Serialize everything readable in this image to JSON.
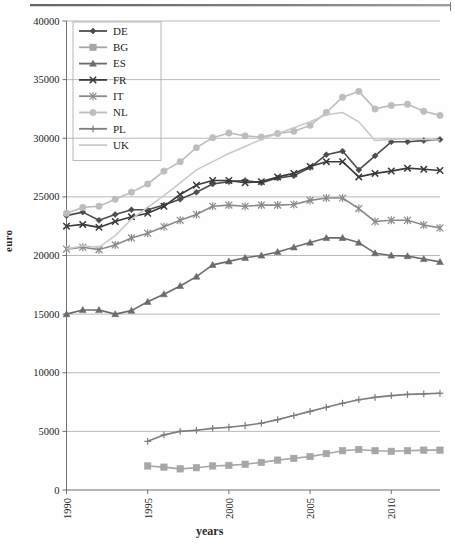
{
  "chart_data": {
    "type": "line",
    "title": "",
    "xlabel": "years",
    "ylabel": "euro",
    "xlim": [
      1990,
      2013
    ],
    "ylim": [
      0,
      40000
    ],
    "ytick_labels": [
      "0",
      "5000",
      "10000",
      "15000",
      "20000",
      "25000",
      "30000",
      "35000",
      "40000"
    ],
    "ytick_values": [
      0,
      5000,
      10000,
      15000,
      20000,
      25000,
      30000,
      35000,
      40000
    ],
    "xtick_labels": [
      "1990",
      "1995",
      "2000",
      "2005",
      "2010"
    ],
    "xtick_values": [
      1990,
      1995,
      2000,
      2005,
      2010
    ],
    "grid": "horizontal",
    "legend_position": "top-left",
    "x": [
      1990,
      1991,
      1992,
      1993,
      1994,
      1995,
      1996,
      1997,
      1998,
      1999,
      2000,
      2001,
      2002,
      2003,
      2004,
      2005,
      2006,
      2007,
      2008,
      2009,
      2010,
      2011,
      2012,
      2013
    ],
    "series": [
      {
        "name": "DE",
        "label": "DE",
        "color": "#4d4d4d",
        "marker": "diamond",
        "x": [
          1990,
          1991,
          1992,
          1993,
          1994,
          1995,
          1996,
          1997,
          1998,
          1999,
          2000,
          2001,
          2002,
          2003,
          2004,
          2005,
          2006,
          2007,
          2008,
          2009,
          2010,
          2011,
          2012,
          2013
        ],
        "values": [
          23400,
          23700,
          23000,
          23500,
          23900,
          23900,
          24300,
          24800,
          25400,
          26100,
          26300,
          26400,
          26200,
          26600,
          26800,
          27500,
          28600,
          28900,
          27300,
          28500,
          29700,
          29700,
          29800,
          29900
        ]
      },
      {
        "name": "BG",
        "label": "BG",
        "color": "#a6a6a6",
        "marker": "square",
        "x": [
          1995,
          1996,
          1997,
          1998,
          1999,
          2000,
          2001,
          2002,
          2003,
          2004,
          2005,
          2006,
          2007,
          2008,
          2009,
          2010,
          2011,
          2012,
          2013
        ],
        "values": [
          2050,
          1950,
          1800,
          1900,
          2050,
          2100,
          2200,
          2350,
          2550,
          2700,
          2850,
          3100,
          3350,
          3450,
          3350,
          3300,
          3350,
          3400,
          3400
        ]
      },
      {
        "name": "ES",
        "label": "ES",
        "color": "#6b6b6b",
        "marker": "triangle",
        "x": [
          1990,
          1991,
          1992,
          1993,
          1994,
          1995,
          1996,
          1997,
          1998,
          1999,
          2000,
          2001,
          2002,
          2003,
          2004,
          2005,
          2006,
          2007,
          2008,
          2009,
          2010,
          2011,
          2012,
          2013
        ],
        "values": [
          15000,
          15350,
          15350,
          15000,
          15300,
          16050,
          16700,
          17400,
          18200,
          19200,
          19500,
          19800,
          20000,
          20300,
          20700,
          21100,
          21500,
          21500,
          21100,
          20200,
          20000,
          19950,
          19700,
          19450
        ]
      },
      {
        "name": "FR",
        "label": "FR",
        "color": "#3a3a3a",
        "marker": "x-cross",
        "x": [
          1990,
          1991,
          1992,
          1993,
          1994,
          1995,
          1996,
          1997,
          1998,
          1999,
          2000,
          2001,
          2002,
          2003,
          2004,
          2005,
          2006,
          2007,
          2008,
          2009,
          2010,
          2011,
          2012,
          2013
        ],
        "values": [
          22500,
          22650,
          22400,
          22900,
          23300,
          23600,
          24200,
          25200,
          26000,
          26400,
          26400,
          26200,
          26300,
          26700,
          27000,
          27600,
          28000,
          28000,
          26700,
          27000,
          27200,
          27450,
          27350,
          27250
        ]
      },
      {
        "name": "IT",
        "label": "IT",
        "color": "#8a8a8a",
        "marker": "asterisk",
        "x": [
          1990,
          1991,
          1992,
          1993,
          1994,
          1995,
          1996,
          1997,
          1998,
          1999,
          2000,
          2001,
          2002,
          2003,
          2004,
          2005,
          2006,
          2007,
          2008,
          2009,
          2010,
          2011,
          2012,
          2013
        ],
        "values": [
          20550,
          20700,
          20500,
          20900,
          21500,
          21900,
          22450,
          23000,
          23500,
          24200,
          24300,
          24200,
          24300,
          24300,
          24350,
          24700,
          24900,
          24900,
          24000,
          22900,
          23000,
          23000,
          22600,
          22350
        ]
      },
      {
        "name": "NL",
        "label": "NL",
        "color": "#bdbdbd",
        "marker": "circle",
        "x": [
          1990,
          1991,
          1992,
          1993,
          1994,
          1995,
          1996,
          1997,
          1998,
          1999,
          2000,
          2001,
          2002,
          2003,
          2004,
          2005,
          2006,
          2007,
          2008,
          2009,
          2010,
          2011,
          2012,
          2013
        ],
        "values": [
          23600,
          24100,
          24200,
          24800,
          25400,
          26100,
          27200,
          28000,
          29200,
          30050,
          30450,
          30200,
          30100,
          30400,
          30600,
          31100,
          32200,
          33500,
          34000,
          32500,
          32800,
          32900,
          32300,
          31950
        ]
      },
      {
        "name": "PL",
        "label": "PL",
        "color": "#7d7d7d",
        "marker": "plus",
        "x": [
          1995,
          1996,
          1997,
          1998,
          1999,
          2000,
          2001,
          2002,
          2003,
          2004,
          2005,
          2006,
          2007,
          2008,
          2009,
          2010,
          2011,
          2012,
          2013
        ],
        "values": [
          4150,
          4700,
          5000,
          5100,
          5250,
          5350,
          5500,
          5700,
          6000,
          6350,
          6700,
          7050,
          7400,
          7700,
          7900,
          8050,
          8150,
          8200,
          8250
        ]
      },
      {
        "name": "UK",
        "label": "UK",
        "color": "#c8c8c8",
        "marker": "none",
        "x": [
          1990,
          1991,
          1992,
          1993,
          1994,
          1995,
          1996,
          1997,
          1998,
          1999,
          2000,
          2001,
          2002,
          2003,
          2004,
          2005,
          2006,
          2007,
          2008,
          2009,
          2010,
          2011,
          2012,
          2013
        ],
        "values": [
          20550,
          20800,
          20700,
          21700,
          23100,
          24100,
          25100,
          26200,
          27300,
          28000,
          28700,
          29300,
          29900,
          30400,
          30900,
          31400,
          32000,
          32200,
          31400,
          29800,
          29900,
          29950,
          29900,
          29850
        ]
      }
    ]
  },
  "axes": {
    "ylabel": "euro",
    "xlabel": "years"
  }
}
